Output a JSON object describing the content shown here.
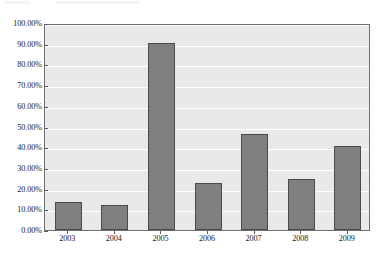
{
  "chart_data": {
    "type": "bar",
    "title": "",
    "xlabel": "",
    "ylabel": "",
    "categories": [
      "2003",
      "2004",
      "2005",
      "2006",
      "2007",
      "2008",
      "2009"
    ],
    "values": [
      13.7,
      12.3,
      90.5,
      22.5,
      46.5,
      24.5,
      40.8
    ],
    "value_labels": [
      "13.70%",
      "12.30%",
      "90.50%",
      "22.50%",
      "46.50%",
      "24.50%",
      "40.80%"
    ],
    "ylim": [
      0,
      100
    ],
    "ytick_values": [
      0,
      10,
      20,
      30,
      40,
      50,
      60,
      70,
      80,
      90,
      100
    ],
    "ytick_labels": [
      "0.00%",
      "10.00%",
      "20.00%",
      "30.00%",
      "40.00%",
      "50.00%",
      "60.00%",
      "70.00%",
      "80.00%",
      "90.00%",
      "100.00%"
    ],
    "grid": true,
    "legend": false,
    "legend_position": "none",
    "series": [
      {
        "name": "",
        "values": [
          13.7,
          12.3,
          90.5,
          22.5,
          46.5,
          24.5,
          40.8
        ]
      }
    ],
    "colors": {
      "bar_fill": "#808080",
      "bar_outline": "#4a4a4a",
      "plot_background": "#e9e9e9",
      "gridline": "#ffffff",
      "axis": "#6f6f6f",
      "text": "#1a1a1a",
      "page_background": "#ffffff"
    }
  }
}
